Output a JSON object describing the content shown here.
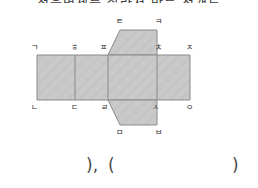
{
  "top_text": "정육면체를 잘라서 만든 전개도",
  "figure": {
    "fill_color": "#c9c9c9",
    "stroke_color": "#8a8a8a",
    "label_color": "#2b2b2b",
    "vertex_labels": {
      "top_flap_left": "ㅌ",
      "top_flap_right": "ㅋ",
      "row_top_1": "ㄱ",
      "row_top_2": "ㅎ",
      "row_top_3": "ㅍ",
      "row_top_4": "ㅊ",
      "row_top_5": "ㅈ",
      "row_bottom_1": "ㄴ",
      "row_bottom_2": "ㄷ",
      "row_bottom_3": "ㄹ",
      "row_bottom_4": "ㅅ",
      "row_bottom_5": "ㅇ",
      "bottom_flap_left": "ㅁ",
      "bottom_flap_right": "ㅂ"
    }
  },
  "answer_line": {
    "close_paren_1": ")",
    "comma": ",",
    "open_paren": "(",
    "close_paren_2": ")"
  }
}
